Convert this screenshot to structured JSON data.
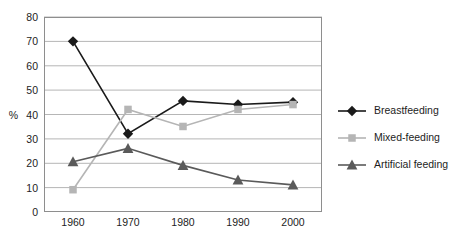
{
  "chart_data": {
    "type": "line",
    "title": "",
    "xlabel": "",
    "ylabel": "%",
    "categories": [
      "1960",
      "1970",
      "1980",
      "1990",
      "2000"
    ],
    "x": [
      1960,
      1970,
      1980,
      1990,
      2000
    ],
    "ylim": [
      0,
      80
    ],
    "yticks": [
      0,
      10,
      20,
      30,
      40,
      50,
      60,
      70,
      80
    ],
    "ytick_labels": [
      "0",
      "10",
      "20",
      "30",
      "40",
      "50",
      "60",
      "70",
      "80"
    ],
    "grid": true,
    "legend_position": "right",
    "series": [
      {
        "name": "Breastfeeding",
        "values": [
          70,
          32,
          45.5,
          44,
          45
        ],
        "color": "#1a1a1a",
        "marker": "diamond"
      },
      {
        "name": "Mixed-feeding",
        "values": [
          9,
          42,
          35,
          42,
          44
        ],
        "color": "#b5b5b5",
        "marker": "square"
      },
      {
        "name": "Artificial feeding",
        "values": [
          20.5,
          26,
          19,
          13,
          11
        ],
        "color": "#5a5a5a",
        "marker": "triangle"
      }
    ]
  },
  "legend": {
    "items": [
      {
        "label": "Breastfeeding"
      },
      {
        "label": "Mixed-feeding"
      },
      {
        "label": "Artificial feeding"
      }
    ]
  },
  "axis": {
    "y_label": "%",
    "y_ticks": [
      "80",
      "70",
      "60",
      "50",
      "40",
      "30",
      "20",
      "10",
      "0"
    ],
    "x_ticks": [
      "1960",
      "1970",
      "1980",
      "1990",
      "2000"
    ]
  }
}
